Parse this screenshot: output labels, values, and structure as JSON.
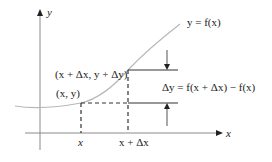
{
  "diagram": {
    "type": "function-increment",
    "axes": {
      "x_label": "x",
      "y_label": "y"
    },
    "curve_label": "y = f(x)",
    "points": {
      "lower": "(x, y)",
      "upper": "(x + Δx, y + Δy)"
    },
    "tick_labels": {
      "x": "x",
      "x_plus_dx": "x + Δx"
    },
    "delta_y_label": "Δy = f(x + Δx) − f(x)",
    "colors": {
      "curve": "#b8b8b8",
      "axis": "#8a8a8a",
      "lines": "#333333",
      "text": "#222222"
    }
  }
}
